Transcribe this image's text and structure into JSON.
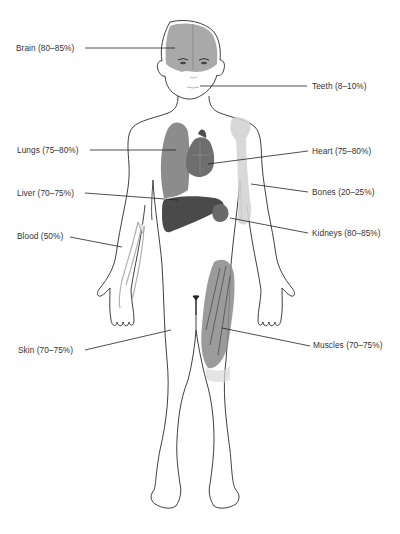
{
  "diagram": {
    "type": "anatomical-body-water-content",
    "labels": [
      {
        "id": "brain",
        "text": "Brain (80–85%)",
        "side": "left",
        "x": 16,
        "y": 43
      },
      {
        "id": "teeth",
        "text": "Teeth (8–10%)",
        "side": "right",
        "x": 312,
        "y": 81
      },
      {
        "id": "lungs",
        "text": "Lungs (75–80%)",
        "side": "left",
        "x": 17,
        "y": 145
      },
      {
        "id": "heart",
        "text": "Heart (75–80%)",
        "side": "right",
        "x": 312,
        "y": 146
      },
      {
        "id": "liver",
        "text": "Liver (70–75%)",
        "side": "left",
        "x": 17,
        "y": 188
      },
      {
        "id": "bones",
        "text": "Bones (20–25%)",
        "side": "right",
        "x": 312,
        "y": 187
      },
      {
        "id": "blood",
        "text": "Blood (50%)",
        "side": "left",
        "x": 17,
        "y": 231
      },
      {
        "id": "kidneys",
        "text": "Kidneys (80–85%)",
        "side": "right",
        "x": 312,
        "y": 228
      },
      {
        "id": "skin",
        "text": "Skin (70–75%)",
        "side": "left",
        "x": 18,
        "y": 345
      },
      {
        "id": "muscles",
        "text": "Muscles (70–75%)",
        "side": "right",
        "x": 313,
        "y": 340
      }
    ],
    "colors": {
      "outline": "#2a2a2a",
      "leader": "#222222",
      "brain": "#9a9a9a",
      "lung": "#8c8c8c",
      "heart": "#6e6e6e",
      "liver": "#4a4a4a",
      "kidney": "#6a6a6a",
      "bone": "#d4d4d4",
      "muscle": "#8a8a8a",
      "label_text": "#333333"
    }
  }
}
